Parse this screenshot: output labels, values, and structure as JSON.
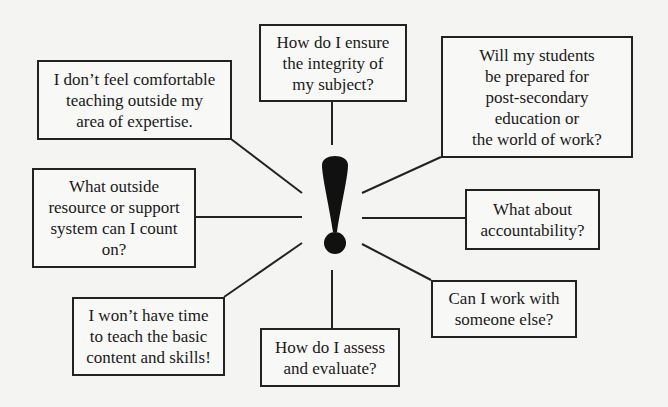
{
  "diagram": {
    "center_symbol": "!",
    "center_symbol_name": "exclamation-mark",
    "line_color": "#222222",
    "boxes": [
      {
        "id": "top-center",
        "text": "How do I ensure\nthe integrity of\nmy subject?"
      },
      {
        "id": "top-left",
        "text": "I don’t feel comfortable\nteaching outside my\narea of expertise."
      },
      {
        "id": "top-right",
        "text": "Will my students\nbe prepared for\npost-secondary\neducation or\nthe world of work?"
      },
      {
        "id": "mid-left",
        "text": "What outside\nresource or support\nsystem can I count\non?"
      },
      {
        "id": "mid-right",
        "text": "What about\naccountability?"
      },
      {
        "id": "bottom-left",
        "text": "I won’t have time\nto teach the basic\ncontent and skills!"
      },
      {
        "id": "bottom-right",
        "text": "Can I work with\nsomeone else?"
      },
      {
        "id": "bottom-center",
        "text": "How do I assess\nand evaluate?"
      }
    ]
  }
}
